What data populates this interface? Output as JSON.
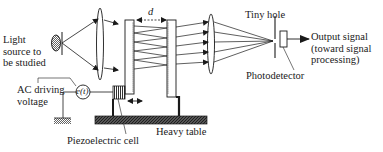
{
  "diagram": {
    "type": "optical-schematic",
    "labels": {
      "light_source": [
        "Light",
        "source to",
        "be studied"
      ],
      "ac_voltage": [
        "AC driving",
        "voltage"
      ],
      "emf_symbol": "e(t)",
      "spacing": "d",
      "tiny_hole": "Tiny hole",
      "output_signal": [
        "Output signal",
        "(toward signal",
        "processing)"
      ],
      "photodetector": "Photodetector",
      "piezo_cell": "Piezoelectric cell",
      "heavy_table": "Heavy table"
    },
    "components": [
      "light-source",
      "collimating-lens",
      "movable-mirror",
      "fixed-mirror",
      "focusing-lens",
      "pinhole-aperture",
      "photodetector",
      "piezoelectric-cell",
      "ac-voltage-source",
      "ground",
      "heavy-table"
    ],
    "colors": {
      "line": "#1a1a1a",
      "background": "#ffffff",
      "hatch": "#333333"
    }
  }
}
